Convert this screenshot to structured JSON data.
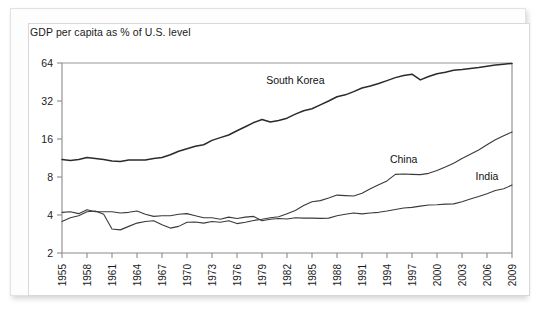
{
  "chart_data": {
    "type": "line",
    "title": "GDP per capita as % of U.S. level",
    "xlabel": "",
    "ylabel": "",
    "yscale": "log2",
    "ylim": [
      2,
      64
    ],
    "yticks": [
      2,
      4,
      8,
      16,
      32,
      64
    ],
    "ytick_labels": [
      "2",
      "4",
      "8",
      "16",
      "32",
      "64"
    ],
    "xlim": [
      1955,
      2009
    ],
    "xticks": [
      1955,
      1958,
      1961,
      1964,
      1967,
      1970,
      1973,
      1976,
      1979,
      1982,
      1985,
      1988,
      1991,
      1994,
      1997,
      2000,
      2003,
      2006,
      2009
    ],
    "xtick_labels": [
      "1955",
      "1958",
      "1961",
      "1964",
      "1967",
      "1970",
      "1973",
      "1976",
      "1979",
      "1982",
      "1985",
      "1988",
      "1991",
      "1994",
      "1997",
      "2000",
      "2003",
      "2006",
      "2009"
    ],
    "grid": false,
    "legend_position": "inline-annotations",
    "annotations": [
      {
        "text": "South Korea",
        "x": 1983,
        "y": 44
      },
      {
        "text": "China",
        "x": 1996,
        "y": 10.4
      },
      {
        "text": "India",
        "x": 2006,
        "y": 7.6
      }
    ],
    "x": [
      1955,
      1956,
      1957,
      1958,
      1959,
      1960,
      1961,
      1962,
      1963,
      1964,
      1965,
      1966,
      1967,
      1968,
      1969,
      1970,
      1971,
      1972,
      1973,
      1974,
      1975,
      1976,
      1977,
      1978,
      1979,
      1980,
      1981,
      1982,
      1983,
      1984,
      1985,
      1986,
      1987,
      1988,
      1989,
      1990,
      1991,
      1992,
      1993,
      1994,
      1995,
      1996,
      1997,
      1998,
      1999,
      2000,
      2001,
      2002,
      2003,
      2004,
      2005,
      2006,
      2007,
      2008,
      2009
    ],
    "series": [
      {
        "name": "South Korea",
        "values": [
          11.0,
          10.8,
          11.0,
          11.4,
          11.2,
          11.0,
          10.7,
          10.6,
          10.9,
          10.9,
          10.9,
          11.2,
          11.4,
          12.0,
          12.8,
          13.4,
          14.0,
          14.4,
          15.6,
          16.4,
          17.2,
          18.6,
          20.0,
          21.6,
          22.8,
          21.8,
          22.4,
          23.4,
          25.2,
          26.8,
          27.8,
          29.8,
          32.0,
          34.6,
          35.8,
          38.0,
          40.6,
          42.0,
          44.0,
          46.4,
          49.0,
          51.0,
          52.2,
          47.0,
          50.0,
          52.6,
          54.0,
          56.0,
          56.8,
          58.0,
          59.0,
          60.4,
          61.8,
          62.6,
          63.5
        ]
      },
      {
        "name": "China",
        "values": [
          3.55,
          3.8,
          3.95,
          4.25,
          4.3,
          4.05,
          3.1,
          3.05,
          3.25,
          3.45,
          3.55,
          3.6,
          3.35,
          3.15,
          3.25,
          3.5,
          3.52,
          3.45,
          3.55,
          3.5,
          3.6,
          3.42,
          3.5,
          3.62,
          3.7,
          3.8,
          3.88,
          4.1,
          4.35,
          4.75,
          5.1,
          5.2,
          5.45,
          5.75,
          5.7,
          5.65,
          5.95,
          6.45,
          6.95,
          7.45,
          8.4,
          8.45,
          8.4,
          8.35,
          8.55,
          9.0,
          9.6,
          10.3,
          11.2,
          12.1,
          13.1,
          14.4,
          15.8,
          17.0,
          18.2
        ]
      },
      {
        "name": "India",
        "values": [
          4.2,
          4.25,
          4.1,
          4.4,
          4.25,
          4.25,
          4.25,
          4.15,
          4.2,
          4.3,
          4.05,
          3.9,
          3.95,
          3.95,
          4.05,
          4.1,
          3.95,
          3.8,
          3.8,
          3.7,
          3.85,
          3.75,
          3.85,
          3.9,
          3.6,
          3.7,
          3.75,
          3.72,
          3.8,
          3.78,
          3.78,
          3.76,
          3.78,
          3.95,
          4.05,
          4.15,
          4.08,
          4.15,
          4.2,
          4.3,
          4.42,
          4.55,
          4.6,
          4.7,
          4.8,
          4.82,
          4.88,
          4.9,
          5.1,
          5.35,
          5.6,
          5.9,
          6.25,
          6.45,
          6.9
        ]
      }
    ]
  }
}
